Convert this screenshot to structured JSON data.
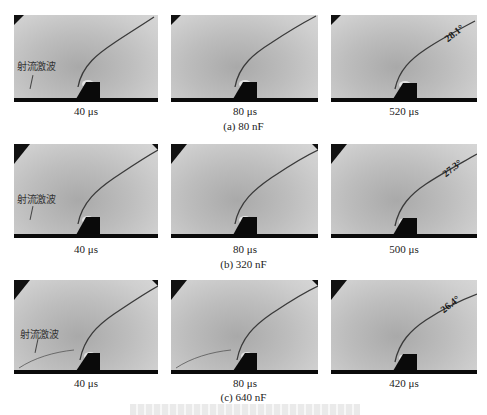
{
  "figure": {
    "rows": [
      {
        "caption": "(a) 80 nF",
        "panels": [
          {
            "time": "40 μs",
            "label": "射流激波",
            "angle": ""
          },
          {
            "time": "80 μs",
            "label": "",
            "angle": ""
          },
          {
            "time": "520 μs",
            "label": "",
            "angle": "28.1°"
          }
        ]
      },
      {
        "caption": "(b) 320 nF",
        "panels": [
          {
            "time": "40 μs",
            "label": "射流激波",
            "angle": ""
          },
          {
            "time": "80 μs",
            "label": "",
            "angle": ""
          },
          {
            "time": "500 μs",
            "label": "",
            "angle": "27.3°"
          }
        ]
      },
      {
        "caption": "(c) 640 nF",
        "panels": [
          {
            "time": "40 μs",
            "label": "射流激波",
            "angle": ""
          },
          {
            "time": "80 μs",
            "label": "",
            "angle": ""
          },
          {
            "time": "420 μs",
            "label": "",
            "angle": "26.4°"
          }
        ]
      }
    ],
    "colors": {
      "background": "#ffffff",
      "panel_gray": "#c4c4c4",
      "obstacle": "#0a0a0a",
      "shock_line": "#3a3a3a"
    }
  }
}
